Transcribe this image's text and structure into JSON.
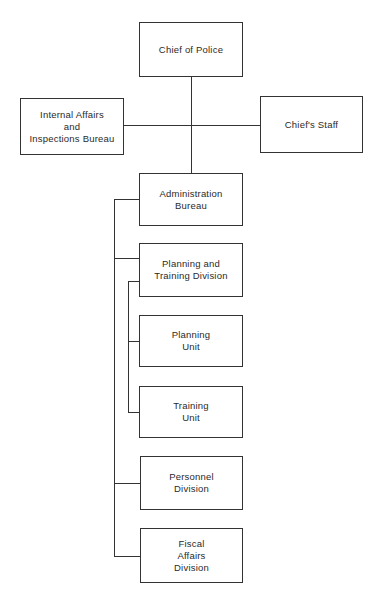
{
  "chart": {
    "nodes": [
      {
        "id": "chief",
        "label": "Chief of Police",
        "x": 139,
        "y": 22,
        "w": 104,
        "h": 55
      },
      {
        "id": "internal_affairs",
        "label": "Internal Affairs\nand\nInspections Bureau",
        "x": 20,
        "y": 98,
        "w": 104,
        "h": 57
      },
      {
        "id": "chiefs_staff",
        "label": "Chief's Staff",
        "x": 260,
        "y": 96,
        "w": 103,
        "h": 57
      },
      {
        "id": "admin_bureau",
        "label": "Administration\nBureau",
        "x": 139,
        "y": 173,
        "w": 104,
        "h": 53
      },
      {
        "id": "planning_training",
        "label": "Planning and\nTraining Division",
        "x": 139,
        "y": 243,
        "w": 104,
        "h": 54
      },
      {
        "id": "planning_unit",
        "label": "Planning\nUnit",
        "x": 139,
        "y": 315,
        "w": 104,
        "h": 52
      },
      {
        "id": "training_unit",
        "label": "Training\nUnit",
        "x": 139,
        "y": 386,
        "w": 104,
        "h": 52
      },
      {
        "id": "personnel",
        "label": "Personnel\nDivision",
        "x": 140,
        "y": 456,
        "w": 103,
        "h": 54
      },
      {
        "id": "fiscal",
        "label": "Fiscal\nAffairs\nDivision",
        "x": 140,
        "y": 528,
        "w": 103,
        "h": 55
      }
    ],
    "edges": [
      {
        "from": "chief",
        "to": "admin_bureau"
      },
      {
        "from": "chief",
        "to": "internal_affairs"
      },
      {
        "from": "chief",
        "to": "chiefs_staff"
      },
      {
        "from": "admin_bureau",
        "to": "planning_training"
      },
      {
        "from": "admin_bureau",
        "to": "personnel"
      },
      {
        "from": "admin_bureau",
        "to": "fiscal"
      },
      {
        "from": "planning_training",
        "to": "planning_unit"
      },
      {
        "from": "planning_training",
        "to": "training_unit"
      }
    ],
    "line_color": "#333333"
  }
}
